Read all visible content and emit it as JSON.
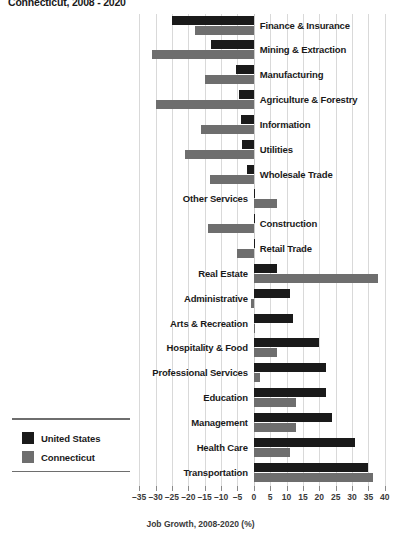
{
  "title": "Connecticut, 2008 - 2020",
  "legend": {
    "items": [
      {
        "label": "United States",
        "color": "#1a1a1a"
      },
      {
        "label": "Connecticut",
        "color": "#6e6e6e"
      }
    ]
  },
  "axis": {
    "xlabel": "Job Growth, 2008-2020 (%)",
    "ticks": [
      "-35",
      "-30",
      "-25",
      "-20",
      "-15",
      "-10",
      "-5",
      "0",
      "5",
      "10",
      "15",
      "20",
      "25",
      "30",
      "35",
      "40"
    ]
  },
  "chart_data": {
    "type": "bar",
    "title": "Connecticut, 2008 - 2020",
    "xlabel": "Job Growth, 2008-2020 (%)",
    "ylabel": "",
    "xlim": [
      -37.5,
      42.5
    ],
    "grid": true,
    "orientation": "horizontal",
    "legend_position": "bottom-left",
    "categories": [
      "Finance & Insurance",
      "Mining & Extraction",
      "Manufacturing",
      "Agriculture & Forestry",
      "Information",
      "Utilities",
      "Wholesale Trade",
      "Other Services",
      "Construction",
      "Retail Trade",
      "Real Estate",
      "Administrative",
      "Arts & Recreation",
      "Hospitality & Food",
      "Professional Services",
      "Education",
      "Management",
      "Health Care",
      "Transportation"
    ],
    "series": [
      {
        "name": "United States",
        "color": "#1a1a1a",
        "values": [
          -25,
          -13,
          -5.5,
          -4.5,
          -4,
          -3.5,
          -2,
          0.5,
          0.5,
          0.5,
          7,
          11,
          12,
          20,
          22,
          22,
          24,
          31,
          35
        ]
      },
      {
        "name": "Connecticut",
        "color": "#6e6e6e",
        "values": [
          -18,
          -31,
          -15,
          -30,
          -16,
          -21,
          -13.5,
          7,
          -14,
          -5,
          38,
          -1,
          0,
          7,
          2,
          13,
          13,
          11,
          36.5
        ]
      }
    ]
  }
}
